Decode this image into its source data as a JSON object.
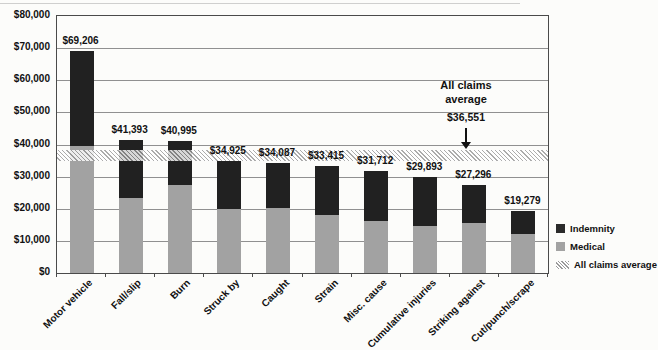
{
  "chart_data": {
    "type": "bar",
    "stacked": true,
    "title": "",
    "xlabel": "",
    "ylabel": "",
    "ylim": [
      0,
      80000
    ],
    "grid": true,
    "legend_position": "right",
    "categories": [
      "Motor vehicle",
      "Fall/slip",
      "Burn",
      "Struck by",
      "Caught",
      "Strain",
      "Misc. cause",
      "Cumulative injuries",
      "Striking against",
      "Cut/punch/scrape"
    ],
    "series": [
      {
        "name": "Medical",
        "color_key": "medical",
        "values": [
          39400,
          23300,
          27300,
          20000,
          20300,
          18100,
          16300,
          14700,
          15600,
          12200
        ]
      },
      {
        "name": "Indemnity",
        "color_key": "indemnity",
        "values": [
          29806,
          18093,
          13695,
          14925,
          13787,
          15315,
          15412,
          15193,
          11696,
          7079
        ]
      }
    ],
    "totals": [
      69206,
      41393,
      40995,
      34925,
      34087,
      33415,
      31712,
      29893,
      27296,
      19279
    ],
    "total_labels": [
      "$69,206",
      "$41,393",
      "$40,995",
      "$34,925",
      "$34,087",
      "$33,415",
      "$31,712",
      "$29,893",
      "$27,296",
      "$19,279"
    ],
    "y_tick_labels": [
      "$0",
      "$10,000",
      "$20,000",
      "$30,000",
      "$40,000",
      "$50,000",
      "$60,000",
      "$70,000",
      "$80,000"
    ],
    "y_tick_values": [
      0,
      10000,
      20000,
      30000,
      40000,
      50000,
      60000,
      70000,
      80000
    ],
    "reference_line": {
      "label": "All claims average",
      "value": 36551,
      "value_label": "$36,551"
    }
  },
  "legend": {
    "items": [
      {
        "label": "Indemnity",
        "swatch": "indemnity"
      },
      {
        "label": "Medical",
        "swatch": "medical"
      },
      {
        "label": "All claims average",
        "swatch": "hatch"
      }
    ]
  },
  "colors": {
    "indemnity": "#212121",
    "medical": "#a2a2a2",
    "hatch_line": "#9a9a9a",
    "grid": "#909090",
    "border": "#4a4a4a",
    "text": "#111111",
    "background": "#fcfcfa"
  }
}
